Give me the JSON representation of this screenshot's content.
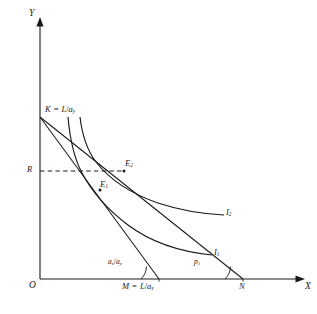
{
  "figure": {
    "domain": "diagram",
    "kind": "economics-trade-diagram",
    "background_color": "#ffffff",
    "line_color": "#1a1a1a",
    "axes": {
      "x_label": "X",
      "y_label": "Y",
      "origin_label": "O"
    },
    "points": {
      "K": {
        "label": "K",
        "equation_op": "=",
        "equation_rhs_num": "L",
        "equation_rhs_slash": "/",
        "equation_rhs_den": "a",
        "equation_rhs_den_sub": "y",
        "full_text": "K = L/a_y"
      },
      "M": {
        "label": "M",
        "equation_op": "=",
        "equation_rhs_num": "L",
        "equation_rhs_slash": "/",
        "equation_rhs_den": "a",
        "equation_rhs_den_sub": "x",
        "full_text": "M = L/a_x"
      },
      "N": {
        "label": "N"
      },
      "R": {
        "label": "R"
      },
      "E1": {
        "label": "E",
        "sub": "1"
      },
      "E2": {
        "label": "E",
        "sub": "2"
      }
    },
    "curves": {
      "I1": {
        "label": "I",
        "sub": "1"
      },
      "I2": {
        "label": "I",
        "sub": "2"
      }
    },
    "slopes": {
      "domestic": {
        "num": "a",
        "num_sub": "x",
        "slash": "/",
        "den": "a",
        "den_sub": "y",
        "full_text": "a_x/a_y"
      },
      "world_price": {
        "label": "p",
        "sub": "1",
        "full_text": "p_1"
      }
    }
  }
}
